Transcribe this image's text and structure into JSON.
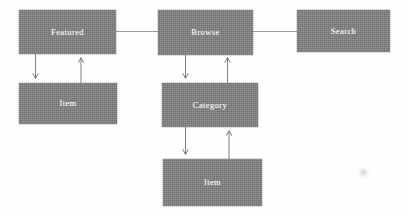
{
  "diagram": {
    "type": "flow-diagram",
    "canvas": {
      "width": 410,
      "height": 215,
      "background": "#fefefe"
    },
    "style": {
      "node_fill": "#7e7e7e",
      "node_label_color": "#ffffff",
      "edge_color": "#8d8d8d",
      "arrow_color": "#6f6f6f"
    },
    "nodes": [
      {
        "id": "featured",
        "label": "Featured",
        "x": 19,
        "y": 10,
        "w": 97,
        "h": 44
      },
      {
        "id": "browse",
        "label": "Browse",
        "x": 158,
        "y": 10,
        "w": 95,
        "h": 45
      },
      {
        "id": "search",
        "label": "Search",
        "x": 297,
        "y": 10,
        "w": 93,
        "h": 42
      },
      {
        "id": "item_left",
        "label": "Item",
        "x": 19,
        "y": 83,
        "w": 98,
        "h": 41
      },
      {
        "id": "category",
        "label": "Category",
        "x": 162,
        "y": 83,
        "w": 96,
        "h": 44
      },
      {
        "id": "item_bottom",
        "label": "Item",
        "x": 163,
        "y": 159,
        "w": 99,
        "h": 47
      }
    ],
    "edges": [
      {
        "id": "featured-browse",
        "from": "featured",
        "to": "browse",
        "kind": "line",
        "direction": "none"
      },
      {
        "id": "browse-search",
        "from": "browse",
        "to": "search",
        "kind": "line",
        "direction": "none"
      },
      {
        "id": "featured-item",
        "from": "featured",
        "to": "item_left",
        "kind": "arrow",
        "direction": "down"
      },
      {
        "id": "item-featured",
        "from": "item_left",
        "to": "featured",
        "kind": "arrow",
        "direction": "up"
      },
      {
        "id": "browse-category",
        "from": "browse",
        "to": "category",
        "kind": "arrow",
        "direction": "down"
      },
      {
        "id": "category-browse",
        "from": "category",
        "to": "browse",
        "kind": "arrow",
        "direction": "up"
      },
      {
        "id": "category-item",
        "from": "category",
        "to": "item_bottom",
        "kind": "arrow",
        "direction": "down"
      },
      {
        "id": "item-category",
        "from": "item_bottom",
        "to": "category",
        "kind": "arrow",
        "direction": "up"
      }
    ],
    "artifact": {
      "x": 357,
      "y": 166,
      "note": "faint scan speck"
    }
  }
}
